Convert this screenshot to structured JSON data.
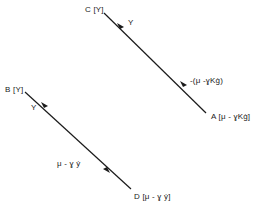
{
  "diagram": {
    "points": {
      "C": {
        "label": "C [Y]"
      },
      "A": {
        "label": "A [μ - ɣKġ]"
      },
      "B": {
        "label": "B [Y]"
      },
      "D": {
        "label": "D [μ - ɣ ẏ]"
      }
    },
    "edges": [
      {
        "from": "A",
        "to": "C",
        "labels": [
          "Y",
          "-(μ - ɣKġ)"
        ]
      },
      {
        "from": "D",
        "to": "B",
        "labels": [
          "Y",
          "μ - ɣ ẏ"
        ]
      }
    ],
    "edge_labels": {
      "ca_upper": "Y",
      "ca_lower": "-(μ -ɣKġ)",
      "bd_upper": "Y",
      "bd_lower": "μ - ɣ ẏ"
    },
    "line_color": "#1a1a1a"
  }
}
